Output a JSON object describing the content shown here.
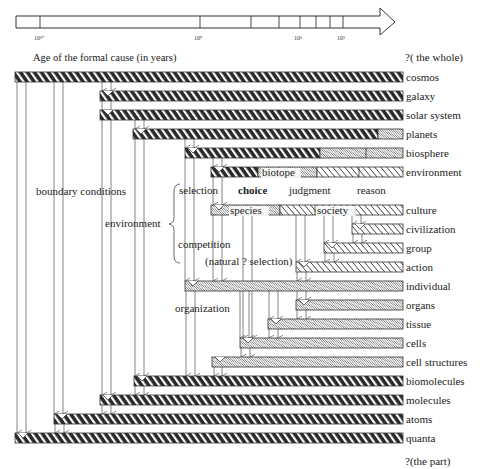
{
  "axis": {
    "caption": "Age of the formal cause (in years)",
    "ticks": [
      {
        "label": "10¹⁰",
        "x": 40
      },
      {
        "label": "10⁹",
        "x": 200
      },
      {
        "label": null,
        "x": 251
      },
      {
        "label": null,
        "x": 279
      },
      {
        "label": "10⁶",
        "x": 300
      },
      {
        "label": null,
        "x": 316
      },
      {
        "label": null,
        "x": 330
      },
      {
        "label": "10³",
        "x": 343
      }
    ],
    "whole_label": "?( the whole)",
    "part_label": "?(the part)"
  },
  "rows": [
    {
      "label": "cosmos",
      "y": 77,
      "x": 15,
      "style": "dark"
    },
    {
      "label": "galaxy",
      "y": 96,
      "x": 100,
      "style": "dark"
    },
    {
      "label": "solar system",
      "y": 115,
      "x": 100,
      "style": "dark"
    },
    {
      "label": "planets",
      "y": 134,
      "x": 133,
      "style": "dark-planets"
    },
    {
      "label": "biosphere",
      "y": 153,
      "x": 185,
      "style": "dark-bio"
    },
    {
      "label": "environment",
      "y": 172,
      "x": 211,
      "style": "env"
    },
    {
      "label": "culture",
      "y": 210,
      "x": 211,
      "style": "culture"
    },
    {
      "label": "civilization",
      "y": 229,
      "x": 352,
      "style": "light"
    },
    {
      "label": "group",
      "y": 248,
      "x": 324,
      "style": "light"
    },
    {
      "label": "action",
      "y": 267,
      "x": 296,
      "style": "light"
    },
    {
      "label": "individual",
      "y": 286,
      "x": 185,
      "style": "dotted"
    },
    {
      "label": "organs",
      "y": 305,
      "x": 296,
      "style": "dotted"
    },
    {
      "label": "tissue",
      "y": 324,
      "x": 268,
      "style": "dotted"
    },
    {
      "label": "cells",
      "y": 343,
      "x": 240,
      "style": "dotted"
    },
    {
      "label": "cell structures",
      "y": 362,
      "x": 212,
      "style": "dotted"
    },
    {
      "label": "biomolecules",
      "y": 381,
      "x": 134,
      "style": "dark"
    },
    {
      "label": "molecules",
      "y": 400,
      "x": 100,
      "style": "dark"
    },
    {
      "label": "atoms",
      "y": 419,
      "x": 54,
      "style": "dark"
    },
    {
      "label": "quanta",
      "y": 438,
      "x": 15,
      "style": "dark"
    }
  ],
  "inline_labels": {
    "biotope": "biotope",
    "species": "species",
    "society": "society"
  },
  "annotations": {
    "boundary_conditions": "boundary conditions",
    "environment": "environment",
    "selection": "selection",
    "choice": "choice",
    "judgment": "judgment",
    "reason": "reason",
    "competition": "competition",
    "natural_selection": "(natural ? selection)",
    "organization": "organization"
  },
  "colors": {
    "dark": "#2b2b2b",
    "line": "#555555",
    "text": "#222222"
  }
}
